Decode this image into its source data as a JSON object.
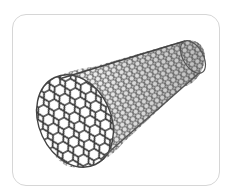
{
  "figure": {
    "subject": "carbon nanotube",
    "alt": "Carbon nanotube illustration",
    "colors": {
      "frame_border": "#d6d6d6",
      "background": "#ffffff",
      "lattice": "#3a3a3a",
      "lattice_far": "#6a6a6a"
    }
  }
}
